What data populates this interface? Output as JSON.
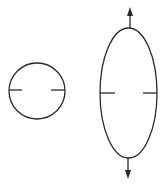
{
  "diagram": {
    "stroke_color": "#2a2a2a",
    "background": "#ffffff",
    "shapes": {
      "circle": {
        "cx": 37,
        "cy": 91,
        "r": 28,
        "tick_left": [
          9,
          22
        ],
        "tick_right": [
          51,
          65
        ],
        "tick_y": 90
      },
      "ellipse": {
        "cx": 128.5,
        "cy": 93,
        "rx": 28.5,
        "ry": 65,
        "tick_left": [
          100,
          115
        ],
        "tick_right": [
          143,
          157
        ],
        "tick_y": 93
      },
      "arrows": [
        {
          "name": "tension-up",
          "x": 130,
          "from_y": 28,
          "to_y": 8
        },
        {
          "name": "tension-down",
          "x": 128,
          "from_y": 158,
          "to_y": 178
        }
      ]
    }
  }
}
